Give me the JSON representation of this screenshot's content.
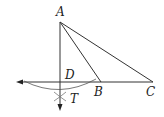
{
  "diagram": {
    "type": "geometry-construction",
    "points": {
      "A": {
        "label": "A",
        "x": 60,
        "y": 22
      },
      "B": {
        "label": "B",
        "x": 101,
        "y": 82
      },
      "C": {
        "label": "C",
        "x": 153,
        "y": 82
      },
      "D": {
        "label": "D",
        "x": 60,
        "y": 82
      },
      "T": {
        "label": "T",
        "x": 60,
        "y": 96
      }
    },
    "segments": [
      "AB",
      "AC",
      "AD",
      "BC"
    ],
    "line_color": "#333333"
  }
}
